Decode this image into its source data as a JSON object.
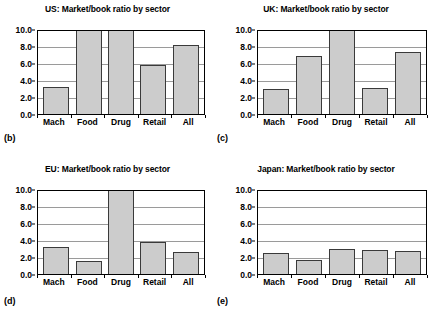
{
  "figure": {
    "panels": [
      {
        "letter": "(b)",
        "title": "US: Market/book ratio by sector"
      },
      {
        "letter": "(c)",
        "title": "UK: Market/book ratio by sector"
      },
      {
        "letter": "(d)",
        "title": "EU: Market/book ratio by sector"
      },
      {
        "letter": "(e)",
        "title": "Japan: Market/book ratio by sector"
      }
    ],
    "y_ticks": [
      "0.0",
      "2.0",
      "4.0",
      "6.0",
      "8.0",
      "10.0"
    ],
    "categories": [
      "Mach",
      "Food",
      "Drug",
      "Retail",
      "All"
    ]
  },
  "chart_data": [
    {
      "type": "bar",
      "title": "US: Market/book ratio by sector",
      "panel_letter": "(b)",
      "categories": [
        "Mach",
        "Food",
        "Drug",
        "Retail",
        "All"
      ],
      "values": [
        3.2,
        10.6,
        10.6,
        5.8,
        8.1
      ],
      "clipped": [
        false,
        true,
        true,
        false,
        false
      ],
      "xlabel": "",
      "ylabel": "",
      "ylim": [
        0.0,
        10.0
      ],
      "ytick_labels": [
        "0.0",
        "2.0",
        "4.0",
        "6.0",
        "8.0",
        "10.0"
      ],
      "grid": true,
      "legend": "none"
    },
    {
      "type": "bar",
      "title": "UK: Market/book ratio by sector",
      "panel_letter": "(c)",
      "categories": [
        "Mach",
        "Food",
        "Drug",
        "Retail",
        "All"
      ],
      "values": [
        3.0,
        6.8,
        10.6,
        3.1,
        7.3
      ],
      "clipped": [
        false,
        false,
        true,
        false,
        false
      ],
      "xlabel": "",
      "ylabel": "",
      "ylim": [
        0.0,
        10.0
      ],
      "ytick_labels": [
        "0.0",
        "2.0",
        "4.0",
        "6.0",
        "8.0",
        "10.0"
      ],
      "grid": true,
      "legend": "none"
    },
    {
      "type": "bar",
      "title": "EU: Market/book ratio by sector",
      "panel_letter": "(d)",
      "categories": [
        "Mach",
        "Food",
        "Drug",
        "Retail",
        "All"
      ],
      "values": [
        3.2,
        1.5,
        10.6,
        3.8,
        2.6
      ],
      "clipped": [
        false,
        false,
        true,
        false,
        false
      ],
      "xlabel": "",
      "ylabel": "",
      "ylim": [
        0.0,
        10.0
      ],
      "ytick_labels": [
        "0.0",
        "2.0",
        "4.0",
        "6.0",
        "8.0",
        "10.0"
      ],
      "grid": true,
      "legend": "none"
    },
    {
      "type": "bar",
      "title": "Japan: Market/book ratio by sector",
      "panel_letter": "(e)",
      "categories": [
        "Mach",
        "Food",
        "Drug",
        "Retail",
        "All"
      ],
      "values": [
        2.5,
        1.65,
        3.0,
        2.85,
        2.65
      ],
      "clipped": [
        false,
        false,
        false,
        false,
        false
      ],
      "xlabel": "",
      "ylabel": "",
      "ylim": [
        0.0,
        10.0
      ],
      "ytick_labels": [
        "0.0",
        "2.0",
        "4.0",
        "6.0",
        "8.0",
        "10.0"
      ],
      "grid": true,
      "legend": "none"
    }
  ],
  "colors": {
    "bar_fill": "#cccccc",
    "bar_border": "#3a3a3a",
    "gridline": "#9a9a9a",
    "axis": "#000000",
    "background": "#ffffff"
  }
}
